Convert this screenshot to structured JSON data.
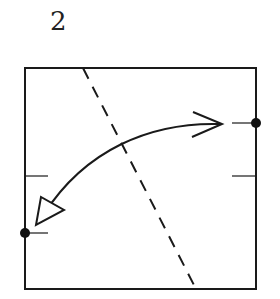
{
  "step": {
    "number": "2"
  },
  "diagram": {
    "colors": {
      "stroke": "#1a1a1a",
      "background": "#ffffff"
    },
    "square": {
      "x": 25,
      "y": 68,
      "width": 231,
      "height": 221
    },
    "fold_line": {
      "style": "dashed",
      "from": [
        83,
        68
      ],
      "to": [
        196,
        289
      ]
    },
    "reference_marks": [
      {
        "side": "right",
        "y": 95
      },
      {
        "side": "right",
        "y": 176
      },
      {
        "side": "left",
        "y": 176
      },
      {
        "side": "left",
        "y": 233
      }
    ],
    "points": [
      {
        "name": "right-point",
        "x": 256,
        "y": 123
      },
      {
        "name": "left-point",
        "x": 25,
        "y": 233
      }
    ],
    "arrow": {
      "from": "right-point",
      "to": "left-point",
      "type": "curved-fold-arrow"
    }
  }
}
